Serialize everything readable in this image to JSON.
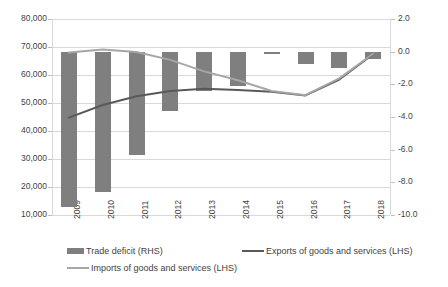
{
  "chart_data": {
    "type": "bar",
    "title": "",
    "subtitle": "",
    "xlabel": "",
    "ylabel": "",
    "categories": [
      "2009",
      "2010",
      "2011",
      "2012",
      "2013",
      "2014",
      "2015",
      "2016",
      "2017",
      "2018"
    ],
    "grid": true,
    "legend_position": "bottom",
    "axes": {
      "left": {
        "label": "",
        "ticks": [
          "10,000",
          "20,000",
          "30,000",
          "40,000",
          "50,000",
          "60,000",
          "70,000",
          "80,000"
        ],
        "tick_values": [
          10000,
          20000,
          30000,
          40000,
          50000,
          60000,
          70000,
          80000
        ],
        "ylim": [
          10000,
          80000
        ]
      },
      "right": {
        "label": "",
        "ticks": [
          "2.0",
          "0.0",
          "-2.0",
          "-4.0",
          "-6.0",
          "-8.0",
          "-10.0"
        ],
        "tick_values": [
          2.0,
          0.0,
          -2.0,
          -4.0,
          -6.0,
          -8.0,
          -10.0
        ],
        "ylim": [
          -10.0,
          2.0
        ]
      }
    },
    "series": [
      {
        "name": "Trade deficit (RHS)",
        "type": "bar",
        "axis": "right",
        "color": "#7f7f7f",
        "values": [
          -9.5,
          -8.6,
          -6.3,
          -3.6,
          -2.4,
          -2.1,
          -0.05,
          -0.75,
          -0.95,
          -0.45
        ]
      },
      {
        "name": "Exports of goods and services (LHS)",
        "type": "line",
        "axis": "left",
        "color": "#595959",
        "values": [
          44800,
          49300,
          52400,
          54300,
          55100,
          54600,
          54000,
          52700,
          58400,
          67400
        ]
      },
      {
        "name": "Imports of goods and services (LHS)",
        "type": "line",
        "axis": "left",
        "color": "#a6a6a6",
        "values": [
          68000,
          69100,
          68200,
          65400,
          61300,
          58100,
          54300,
          52800,
          58800,
          67600
        ]
      }
    ]
  },
  "legend": {
    "items": [
      {
        "label": "Trade deficit (RHS)",
        "marker": "bar-swatch",
        "color": "#7f7f7f"
      },
      {
        "label": "Exports of goods and services (LHS)",
        "marker": "line-swatch",
        "color": "#595959"
      },
      {
        "label": "Imports of goods and services (LHS)",
        "marker": "line-swatch",
        "color": "#a6a6a6"
      }
    ]
  }
}
